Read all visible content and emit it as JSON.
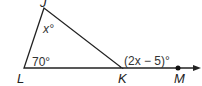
{
  "diagram": {
    "type": "triangle-exterior-angle",
    "points": {
      "J": {
        "label": "J"
      },
      "L": {
        "label": "L"
      },
      "K": {
        "label": "K"
      },
      "M": {
        "label": "M"
      }
    },
    "angles": {
      "J": "x°",
      "L": "70°",
      "K_exterior": "(2x − 5)°"
    },
    "colors": {
      "stroke": "#222222",
      "text": "#333333"
    }
  }
}
